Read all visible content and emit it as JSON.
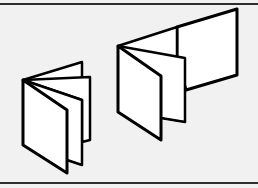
{
  "image": {
    "description": "Line illustration of two accordion-folded brochures",
    "background_color": "#f1f1f1",
    "rule_color": "#2e2e2e",
    "stroke_color": "#000000",
    "panel_fill": "#ffffff"
  },
  "illustrations": [
    {
      "name": "small-accordion-brochure",
      "panels": 4
    },
    {
      "name": "large-accordion-brochure",
      "panels": 3
    }
  ]
}
